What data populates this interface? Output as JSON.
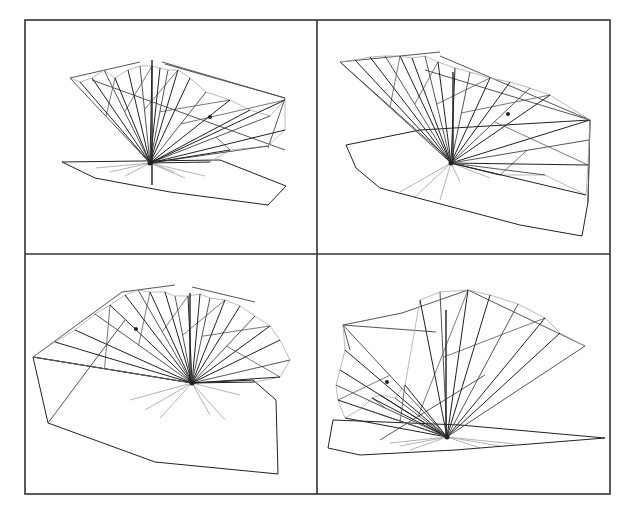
{
  "figure": {
    "frame": {
      "left": 25,
      "top": 20,
      "right": 610,
      "bottom": 494,
      "mid_x": 317,
      "mid_y": 254,
      "stroke": "#333333"
    },
    "colors": {
      "dark": "#222222",
      "mid": "#555555",
      "light": "#aaaaaa",
      "background": "#ffffff"
    },
    "panels": [
      {
        "id": "top-left",
        "apex": [
          150,
          163
        ],
        "dark_rays": [
          [
            70,
            78
          ],
          [
            80,
            82
          ],
          [
            92,
            78
          ],
          [
            104,
            70
          ],
          [
            115,
            78
          ],
          [
            128,
            70
          ],
          [
            140,
            66
          ],
          [
            152,
            66
          ],
          [
            160,
            68
          ],
          [
            168,
            70
          ],
          [
            178,
            70
          ],
          [
            190,
            78
          ],
          [
            206,
            92
          ],
          [
            230,
            100
          ],
          [
            250,
            110
          ],
          [
            270,
            116
          ],
          [
            285,
            100
          ],
          [
            285,
            130
          ],
          [
            268,
            146
          ],
          [
            230,
            150
          ],
          [
            210,
            162
          ]
        ],
        "light_rays": [
          [
            96,
            168
          ],
          [
            110,
            172
          ],
          [
            125,
            176
          ],
          [
            175,
            172
          ],
          [
            185,
            178
          ],
          [
            205,
            176
          ]
        ],
        "outline": [
          [
            62,
            162
          ],
          [
            220,
            160
          ],
          [
            286,
            186
          ],
          [
            268,
            205
          ],
          [
            170,
            192
          ],
          [
            95,
            178
          ],
          [
            62,
            162
          ]
        ],
        "top_edges": [
          [
            [
              70,
              78
            ],
            [
              140,
              62
            ]
          ],
          [
            [
              162,
              62
            ],
            [
              285,
              98
            ]
          ],
          [
            [
              92,
              80
            ],
            [
              285,
              150
            ]
          ],
          [
            [
              285,
              98
            ],
            [
              268,
              148
            ]
          ],
          [
            [
              165,
              64
            ],
            [
              285,
              98
            ]
          ]
        ],
        "vertical": [
          [
            152,
            60
          ],
          [
            152,
            185
          ]
        ],
        "dot": [
          210,
          117
        ]
      },
      {
        "id": "top-right",
        "apex": [
          451,
          163
        ],
        "dark_rays": [
          [
            340,
            62
          ],
          [
            355,
            60
          ],
          [
            370,
            57
          ],
          [
            385,
            56
          ],
          [
            400,
            56
          ],
          [
            412,
            58
          ],
          [
            425,
            56
          ],
          [
            438,
            62
          ],
          [
            455,
            68
          ],
          [
            470,
            72
          ],
          [
            490,
            78
          ],
          [
            510,
            82
          ],
          [
            530,
            88
          ],
          [
            550,
            95
          ],
          [
            590,
            120
          ],
          [
            589,
            140
          ],
          [
            588,
            165
          ],
          [
            586,
            195
          ],
          [
            545,
            175
          ],
          [
            500,
            175
          ]
        ],
        "light_rays": [
          [
            400,
            192
          ],
          [
            415,
            197
          ],
          [
            440,
            200
          ],
          [
            460,
            182
          ],
          [
            490,
            178
          ]
        ],
        "outline": [
          [
            346,
            145
          ],
          [
            420,
            130
          ],
          [
            590,
            120
          ],
          [
            588,
            202
          ],
          [
            582,
            236
          ],
          [
            520,
            225
          ],
          [
            380,
            188
          ],
          [
            356,
            168
          ],
          [
            346,
            145
          ]
        ],
        "top_edges": [
          [
            [
              340,
              62
            ],
            [
              440,
              52
            ]
          ],
          [
            [
              440,
              56
            ],
            [
              590,
              120
            ]
          ],
          [
            [
              425,
              70
            ],
            [
              590,
              120
            ]
          ],
          [
            [
              340,
              62
            ],
            [
              450,
              160
            ]
          ],
          [
            [
              590,
              120
            ],
            [
              588,
              202
            ]
          ]
        ],
        "vertical": [
          [
            453,
            72
          ],
          [
            453,
            160
          ]
        ],
        "dot": [
          508,
          114
        ]
      },
      {
        "id": "bottom-left",
        "apex": [
          192,
          383
        ],
        "dark_rays": [
          [
            33,
            357
          ],
          [
            55,
            342
          ],
          [
            75,
            330
          ],
          [
            95,
            314
          ],
          [
            110,
            305
          ],
          [
            125,
            295
          ],
          [
            138,
            290
          ],
          [
            150,
            292
          ],
          [
            165,
            292
          ],
          [
            175,
            296
          ],
          [
            188,
            296
          ],
          [
            200,
            294
          ],
          [
            210,
            298
          ],
          [
            225,
            300
          ],
          [
            240,
            306
          ],
          [
            255,
            316
          ],
          [
            270,
            326
          ],
          [
            280,
            340
          ],
          [
            290,
            360
          ],
          [
            280,
            377
          ],
          [
            255,
            382
          ]
        ],
        "light_rays": [
          [
            130,
            400
          ],
          [
            145,
            410
          ],
          [
            160,
            418
          ],
          [
            210,
            415
          ],
          [
            225,
            420
          ],
          [
            240,
            395
          ]
        ],
        "outline": [
          [
            48,
            423
          ],
          [
            155,
            462
          ],
          [
            278,
            474
          ],
          [
            276,
            400
          ],
          [
            253,
            380
          ],
          [
            192,
            383
          ],
          [
            33,
            357
          ],
          [
            48,
            423
          ]
        ],
        "top_edges": [
          [
            [
              33,
              357
            ],
            [
              122,
              292
            ]
          ],
          [
            [
              122,
              292
            ],
            [
              175,
              285
            ]
          ],
          [
            [
              192,
              287
            ],
            [
              255,
              302
            ]
          ],
          [
            [
              33,
              357
            ],
            [
              192,
              383
            ]
          ],
          [
            [
              48,
              423
            ],
            [
              125,
              320
            ]
          ]
        ],
        "vertical": [
          [
            190,
            293
          ],
          [
            190,
            383
          ]
        ],
        "dot": [
          136,
          329
        ]
      },
      {
        "id": "bottom-right",
        "apex": [
          447,
          437
        ],
        "dark_rays": [
          [
            343,
            325
          ],
          [
            345,
            350
          ],
          [
            340,
            370
          ],
          [
            336,
            385
          ],
          [
            338,
            400
          ],
          [
            345,
            418
          ],
          [
            362,
            408
          ],
          [
            372,
            398
          ],
          [
            380,
            395
          ],
          [
            395,
            398
          ],
          [
            405,
            385
          ],
          [
            420,
            300
          ],
          [
            440,
            292
          ],
          [
            468,
            290
          ],
          [
            490,
            295
          ],
          [
            518,
            304
          ],
          [
            545,
            318
          ],
          [
            560,
            333
          ],
          [
            585,
            346
          ]
        ],
        "light_rays": [
          [
            390,
            443
          ],
          [
            400,
            446
          ],
          [
            410,
            450
          ],
          [
            480,
            448
          ],
          [
            500,
            446
          ],
          [
            515,
            444
          ]
        ],
        "outline": [
          [
            333,
            420
          ],
          [
            460,
            425
          ],
          [
            605,
            438
          ],
          [
            455,
            450
          ],
          [
            360,
            455
          ],
          [
            328,
            448
          ],
          [
            333,
            420
          ]
        ],
        "top_edges": [
          [
            [
              343,
              325
            ],
            [
              402,
              313
            ]
          ],
          [
            [
              402,
              313
            ],
            [
              468,
              290
            ]
          ],
          [
            [
              468,
              290
            ],
            [
              585,
              346
            ]
          ],
          [
            [
              343,
              325
            ],
            [
              350,
              350
            ]
          ],
          [
            [
              343,
              325
            ],
            [
              436,
              332
            ]
          ],
          [
            [
              380,
              440
            ],
            [
              485,
              375
            ]
          ]
        ],
        "vertical": [
          [
            446,
            310
          ],
          [
            446,
            438
          ]
        ],
        "dot": [
          387,
          382
        ]
      }
    ]
  }
}
